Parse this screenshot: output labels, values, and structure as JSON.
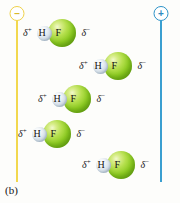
{
  "figure": {
    "panel_label": "(b)",
    "background_color": "#fdfdfb"
  },
  "electrodes": [
    {
      "name": "negative-electrode",
      "sign": "–",
      "polarity": "negative",
      "color": "#f2d84f",
      "position": "left"
    },
    {
      "name": "positive-electrode",
      "sign": "+",
      "polarity": "positive",
      "color": "#3a9fd0",
      "position": "right"
    }
  ],
  "molecule_template": {
    "delta_positive": "δ",
    "delta_positive_sup": "+",
    "delta_negative": "δ",
    "delta_negative_sup": "−",
    "atom_h": "H",
    "atom_f": "F",
    "h_color": "#cdd9e4",
    "f_color": "#8dcb22"
  },
  "molecules": [
    {
      "id": "molecule-1",
      "delta_plus": "δ",
      "delta_plus_sup": "+",
      "h": "H",
      "f": "F",
      "delta_minus": "δ",
      "delta_minus_sup": "−",
      "x": 23,
      "y": 18
    },
    {
      "id": "molecule-2",
      "delta_plus": "δ",
      "delta_plus_sup": "+",
      "h": "H",
      "f": "F",
      "delta_minus": "δ",
      "delta_minus_sup": "−",
      "x": 79,
      "y": 51
    },
    {
      "id": "molecule-3",
      "delta_plus": "δ",
      "delta_plus_sup": "+",
      "h": "H",
      "f": "F",
      "delta_minus": "δ",
      "delta_minus_sup": "−",
      "x": 38,
      "y": 84
    },
    {
      "id": "molecule-4",
      "delta_plus": "δ",
      "delta_plus_sup": "+",
      "h": "H",
      "f": "F",
      "delta_minus": "δ",
      "delta_minus_sup": "−",
      "x": 18,
      "y": 119
    },
    {
      "id": "molecule-5",
      "delta_plus": "δ",
      "delta_plus_sup": "+",
      "h": "H",
      "f": "F",
      "delta_minus": "δ",
      "delta_minus_sup": "−",
      "x": 82,
      "y": 150
    }
  ]
}
